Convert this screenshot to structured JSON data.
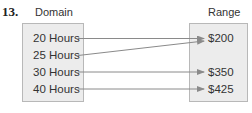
{
  "problem_number": "13.",
  "domain": {
    "label": "Domain",
    "items": [
      "20 Hours",
      "25 Hours",
      "30 Hours",
      "40 Hours"
    ]
  },
  "range": {
    "label": "Range",
    "items": [
      "$200",
      "$350",
      "$425"
    ]
  },
  "mapping": [
    {
      "from": "20 Hours",
      "to": "$200"
    },
    {
      "from": "25 Hours",
      "to": "$200"
    },
    {
      "from": "30 Hours",
      "to": "$350"
    },
    {
      "from": "40 Hours",
      "to": "$425"
    }
  ],
  "colors": {
    "box_fill": "#ececec",
    "box_border": "#b8b8b8",
    "arrow": "#8a8a8a",
    "text": "#333333"
  }
}
